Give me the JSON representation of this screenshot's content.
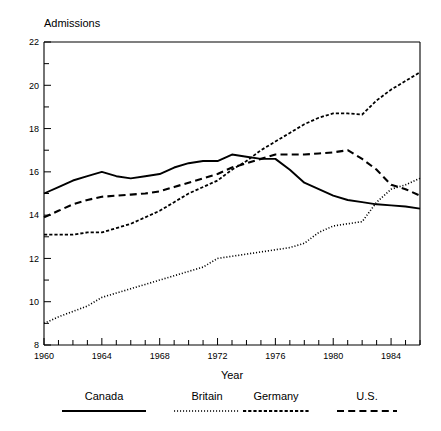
{
  "chart_data": {
    "type": "line",
    "title": "Admissions",
    "xlabel": "Year",
    "ylabel": "Admissions",
    "xlim": [
      1960,
      1986
    ],
    "ylim": [
      8,
      22
    ],
    "grid": false,
    "legend_position": "bottom",
    "x_ticks_major": [
      1960,
      1964,
      1968,
      1972,
      1976,
      1980,
      1984
    ],
    "x_tick_labels": [
      "1960",
      "1964",
      "1968",
      "1972",
      "1976",
      "1980",
      "1984"
    ],
    "x_ticks_minor_step": 1,
    "y_ticks_major": [
      8,
      10,
      12,
      14,
      16,
      18,
      20,
      22
    ],
    "y_tick_labels": [
      "8",
      "10",
      "12",
      "14",
      "16",
      "18",
      "20",
      "22"
    ],
    "y_ticks_minor": [
      9,
      11,
      13,
      15,
      17,
      19,
      21
    ],
    "x": [
      1960,
      1961,
      1962,
      1963,
      1964,
      1965,
      1966,
      1967,
      1968,
      1969,
      1970,
      1971,
      1972,
      1973,
      1974,
      1975,
      1976,
      1977,
      1978,
      1979,
      1980,
      1981,
      1982,
      1983,
      1984,
      1985,
      1986
    ],
    "series": [
      {
        "name": "Canada",
        "style": "solid",
        "values": [
          15.0,
          15.3,
          15.6,
          15.8,
          16.0,
          15.8,
          15.7,
          15.8,
          15.9,
          16.2,
          16.4,
          16.5,
          16.5,
          16.8,
          16.7,
          16.6,
          16.6,
          16.1,
          15.5,
          15.2,
          14.9,
          14.7,
          14.6,
          14.5,
          14.45,
          14.4,
          14.3
        ]
      },
      {
        "name": "Britain",
        "style": "dotted",
        "values": [
          9.0,
          9.3,
          9.55,
          9.8,
          10.2,
          10.4,
          10.6,
          10.8,
          11.0,
          11.2,
          11.4,
          11.6,
          12.0,
          12.1,
          12.2,
          12.3,
          12.4,
          12.5,
          12.7,
          13.2,
          13.5,
          13.6,
          13.7,
          14.6,
          15.2,
          15.4,
          15.7
        ]
      },
      {
        "name": "Germany",
        "style": "dash-dot",
        "values": [
          13.1,
          13.1,
          13.1,
          13.2,
          13.2,
          13.4,
          13.6,
          13.9,
          14.2,
          14.6,
          15.0,
          15.3,
          15.6,
          16.1,
          16.5,
          17.0,
          17.4,
          17.8,
          18.2,
          18.5,
          18.7,
          18.7,
          18.65,
          19.3,
          19.8,
          20.2,
          20.6
        ]
      },
      {
        "name": "U.S.",
        "style": "dashed",
        "values": [
          13.9,
          14.2,
          14.5,
          14.7,
          14.85,
          14.9,
          14.95,
          15.0,
          15.1,
          15.3,
          15.5,
          15.7,
          15.9,
          16.2,
          16.4,
          16.6,
          16.8,
          16.8,
          16.8,
          16.85,
          16.9,
          17.0,
          16.6,
          16.1,
          15.4,
          15.2,
          14.9
        ]
      }
    ]
  },
  "legend": {
    "items": [
      {
        "label": "Canada",
        "style": "solid"
      },
      {
        "label": "Britain",
        "style": "dotted"
      },
      {
        "label": "Germany",
        "style": "dash-dot"
      },
      {
        "label": "U.S.",
        "style": "dashed"
      }
    ]
  }
}
